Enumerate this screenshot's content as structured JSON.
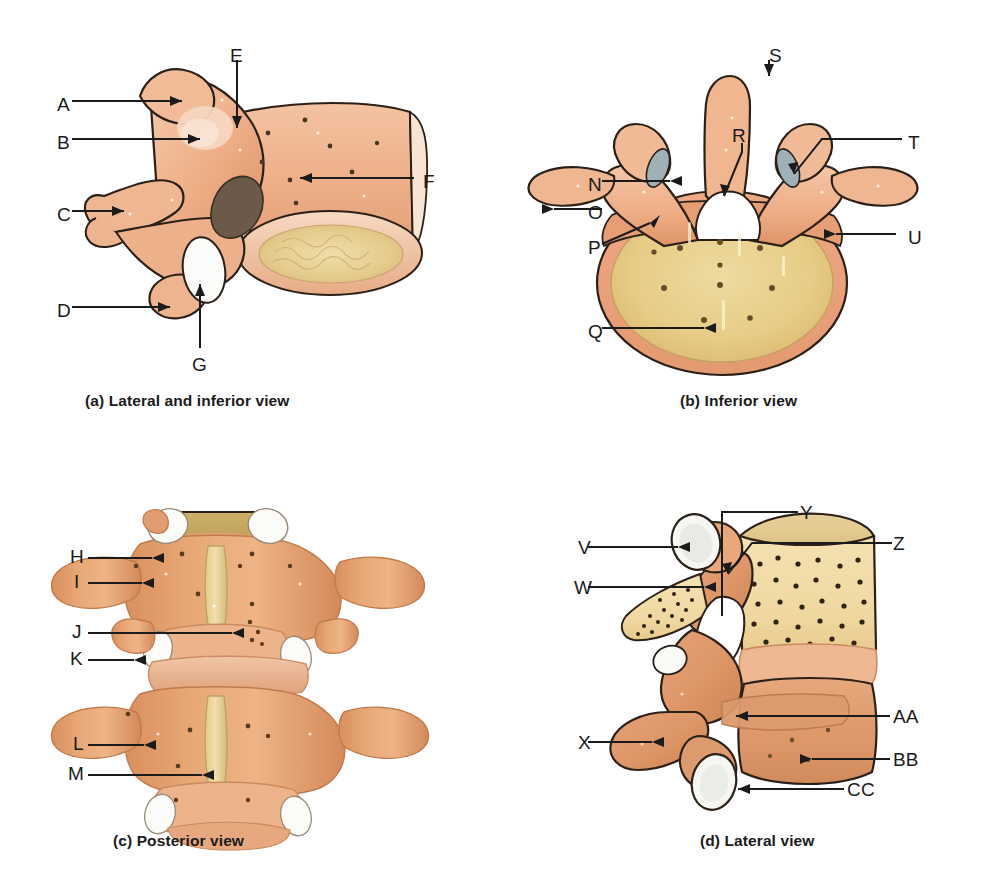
{
  "figure": {
    "background": "#ffffff",
    "label_color": "#1b1b1b",
    "leader_color": "#1b1b1b",
    "bone_colors": {
      "cortical_light": "#f0b894",
      "cortical_mid": "#e09a6e",
      "cortical_dark": "#c87a4f",
      "spongy_yellow": "#e8cf8a",
      "spongy_light": "#f2e2b0",
      "cartilage_white": "#f4f4f2",
      "foramen_dark": "#6b5a4a",
      "outline": "#2a2018"
    }
  },
  "panels": [
    {
      "id": "a",
      "caption": "(a) Lateral and inferior view",
      "caption_x": 85,
      "caption_y": 392,
      "labels": [
        {
          "text": "A",
          "x": 57,
          "y": 95
        },
        {
          "text": "B",
          "x": 57,
          "y": 133
        },
        {
          "text": "C",
          "x": 57,
          "y": 205
        },
        {
          "text": "D",
          "x": 57,
          "y": 301
        },
        {
          "text": "E",
          "x": 230,
          "y": 46
        },
        {
          "text": "F",
          "x": 423,
          "y": 172
        },
        {
          "text": "G",
          "x": 192,
          "y": 355
        }
      ]
    },
    {
      "id": "b",
      "caption": "(b) Inferior view",
      "caption_x": 680,
      "caption_y": 392,
      "labels": [
        {
          "text": "N",
          "x": 588,
          "y": 175
        },
        {
          "text": "O",
          "x": 588,
          "y": 203
        },
        {
          "text": "P",
          "x": 588,
          "y": 238
        },
        {
          "text": "Q",
          "x": 588,
          "y": 322
        },
        {
          "text": "R",
          "x": 732,
          "y": 126
        },
        {
          "text": "S",
          "x": 769,
          "y": 46
        },
        {
          "text": "T",
          "x": 908,
          "y": 133
        },
        {
          "text": "U",
          "x": 908,
          "y": 228
        }
      ]
    },
    {
      "id": "c",
      "caption": "(c) Posterior view",
      "caption_x": 113,
      "caption_y": 832,
      "labels": [
        {
          "text": "H",
          "x": 70,
          "y": 547
        },
        {
          "text": "I",
          "x": 74,
          "y": 572
        },
        {
          "text": "J",
          "x": 72,
          "y": 622
        },
        {
          "text": "K",
          "x": 70,
          "y": 649
        },
        {
          "text": "L",
          "x": 73,
          "y": 734
        },
        {
          "text": "M",
          "x": 68,
          "y": 764
        }
      ]
    },
    {
      "id": "d",
      "caption": "(d) Lateral view",
      "caption_x": 700,
      "caption_y": 832,
      "labels": [
        {
          "text": "V",
          "x": 578,
          "y": 547
        },
        {
          "text": "W",
          "x": 574,
          "y": 587
        },
        {
          "text": "X",
          "x": 578,
          "y": 742
        },
        {
          "text": "Y",
          "x": 800,
          "y": 512
        },
        {
          "text": "Z",
          "x": 893,
          "y": 543
        },
        {
          "text": "AA",
          "x": 893,
          "y": 716
        },
        {
          "text": "BB",
          "x": 893,
          "y": 759
        },
        {
          "text": "CC",
          "x": 840,
          "y": 789
        }
      ]
    }
  ]
}
